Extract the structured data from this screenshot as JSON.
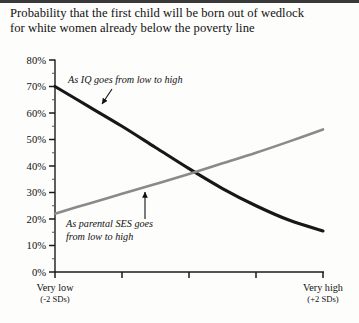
{
  "chart_data": {
    "type": "line",
    "title": "Probability that the first child will be born out of wedlock for white women already below the poverty line",
    "title_lines": [
      "Probability that the first child will be born out of wedlock",
      "for white women already below the poverty line"
    ],
    "xlabel": "",
    "ylabel": "",
    "xlim": [
      -2,
      2
    ],
    "ylim": [
      0,
      80
    ],
    "grid": false,
    "legend_position": "inline-annotations",
    "y_ticks": [
      0,
      10,
      20,
      30,
      40,
      50,
      60,
      70,
      80
    ],
    "y_tick_labels": [
      "0%",
      "10%",
      "20%",
      "30%",
      "40%",
      "50%",
      "60%",
      "70%",
      "80%"
    ],
    "y_minor_ticks": [
      5,
      15,
      25,
      35,
      45,
      55,
      65,
      75
    ],
    "x_ticks": [
      -2,
      -1,
      0,
      1,
      2
    ],
    "x_tick_labels": [
      "",
      "",
      "",
      "",
      ""
    ],
    "x_axis_captions": [
      {
        "at": -2,
        "line1": "Very low",
        "line2": "(-2 SDs)"
      },
      {
        "at": 2,
        "line1": "Very high",
        "line2": "(+2 SDs)"
      }
    ],
    "series": [
      {
        "name": "As IQ goes from low to high",
        "color": "#171717",
        "width": 3.1,
        "x": [
          -2,
          -1.5,
          -1,
          -0.5,
          0,
          0.5,
          1,
          1.5,
          2
        ],
        "values": [
          70,
          62.5,
          55,
          47,
          39,
          31.5,
          25,
          19.5,
          15.5
        ]
      },
      {
        "name": "As parental SES goes from low to high",
        "color": "#8a8a8a",
        "width": 2.6,
        "x": [
          -2,
          -1.5,
          -1,
          -0.5,
          0,
          0.5,
          1,
          1.5,
          2
        ],
        "values": [
          22,
          25.8,
          29.5,
          33.2,
          37,
          41,
          45,
          49.3,
          53.8
        ]
      }
    ],
    "annotations": [
      {
        "id": "iq-annotation",
        "text_lines": [
          "As IQ goes from low to high"
        ],
        "text_x": 68,
        "text_y": 83,
        "arrow_from": [
          112,
          89
        ],
        "arrow_to": [
          102,
          104
        ]
      },
      {
        "id": "ses-annotation",
        "text_lines": [
          "As parental SES goes",
          "from low to high"
        ],
        "text_x": 66,
        "text_y": 227,
        "arrow_from": [
          145,
          219
        ],
        "arrow_to": [
          145,
          192
        ]
      }
    ]
  },
  "colors": {
    "background": "#fdfdfc",
    "axis": "#1a1a1a",
    "text": "#111111",
    "series_iq": "#171717",
    "series_ses": "#8a8a8a"
  }
}
